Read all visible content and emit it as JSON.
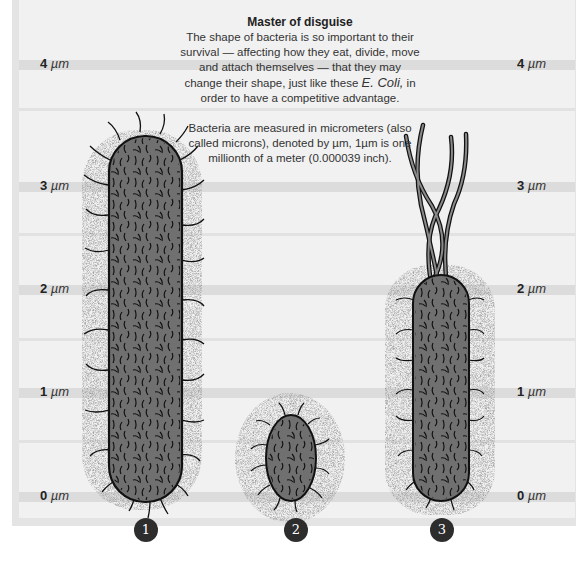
{
  "caption": {
    "title": "Master of disguise",
    "paragraph_1": "The shape of bacteria is so important to their survival — affecting how they eat, divide, move and attach themselves — that they may change their shape, just like these E. Coli, in order to have a competitive advantage.",
    "paragraph_1_parts": {
      "before": "The shape of bacteria is so important to their survival — affecting how they eat, divide, move and attach themselves — that they may change their shape, just like these ",
      "species": "E. Coli,",
      "after": " in order to have a competitive advantage."
    },
    "paragraph_2": "Bacteria are measured in micrometers (also called microns), denoted by µm, 1µm is one millionth of a meter (0.000039 inch)."
  },
  "scale": {
    "unit": "µm",
    "ticks": [
      {
        "value": "4",
        "unit": "µm"
      },
      {
        "value": "3",
        "unit": "µm"
      },
      {
        "value": "2",
        "unit": "µm"
      },
      {
        "value": "1",
        "unit": "µm"
      },
      {
        "value": "0",
        "unit": "µm"
      }
    ]
  },
  "bacteria": [
    {
      "marker": "1",
      "shape": "long rod",
      "approx_length_um": 3.3
    },
    {
      "marker": "2",
      "shape": "short oval",
      "approx_length_um": 0.8
    },
    {
      "marker": "3",
      "shape": "rod with flagella",
      "approx_length_um": 2.1
    }
  ],
  "colors": {
    "background": "#f1f1f1",
    "frame": "#e4e4e4",
    "band": "#dcdcdc",
    "cell_fill": "#6e6e6e",
    "outline": "#111111",
    "marker": "#2d2d2d"
  }
}
